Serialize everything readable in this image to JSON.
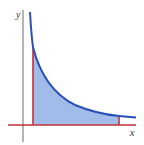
{
  "figure": {
    "axis_labels": {
      "x": "x",
      "y": "y"
    },
    "colors": {
      "curve": "#2a4fb5",
      "fill": "#9db8e8",
      "bounds": "#c0303a",
      "axes": "#444444"
    }
  }
}
